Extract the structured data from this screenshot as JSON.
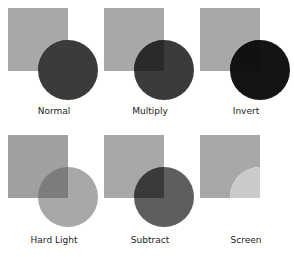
{
  "panels": [
    {
      "label": "Normal",
      "square_color": "#a8a8a8",
      "circle_color": "#3b3b3b",
      "overlap_color": "#3b3b3b"
    },
    {
      "label": "Multiply",
      "square_color": "#a8a8a8",
      "circle_color": "#3b3b3b",
      "overlap_color": "#2a2a2a"
    },
    {
      "label": "Invert",
      "square_color": "#a8a8a8",
      "circle_color": "#141414",
      "overlap_color": "#111111"
    },
    {
      "label": "Hard Light",
      "square_color": "#a0a0a0",
      "circle_color": "#a8a8a8",
      "overlap_color": "#7c7c7c"
    },
    {
      "label": "Subtract",
      "square_color": "#a8a8a8",
      "circle_color": "#5e5e5e",
      "overlap_color": "#3a3a3a"
    },
    {
      "label": "Screen",
      "square_color": "#a8a8a8",
      "circle_color": "#ffffff",
      "overlap_color": "#cacaca"
    }
  ]
}
